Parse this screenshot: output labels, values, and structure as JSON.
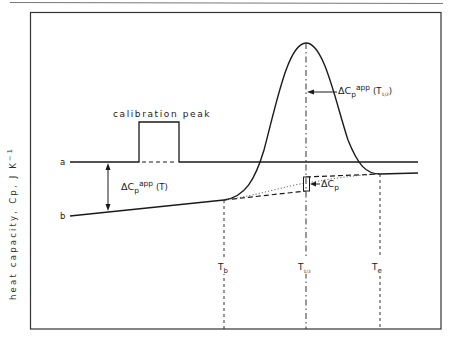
{
  "figure": {
    "y_axis_label": "heat  capacity, Cp,  J K",
    "y_axis_unit_exp": "−1",
    "calibration_label": "calibration  peak",
    "line_a_label": "a",
    "line_b_label": "b",
    "delta_cp_app_T": {
      "main": "ΔC",
      "sub": "p",
      "sup": "app",
      "arg": "(T)"
    },
    "delta_cp_app_Thalf": {
      "main": "ΔC",
      "sub": "p",
      "sup": "app",
      "arg_open": "(T",
      "arg_sub": "1/2",
      "arg_close": ")"
    },
    "delta_cp": {
      "main": "ΔC",
      "sub": "p"
    },
    "x_markers": [
      {
        "main": "T",
        "sub": "b"
      },
      {
        "main": "T",
        "sub": "1/2"
      },
      {
        "main": "T",
        "sub": "e"
      }
    ]
  },
  "colors": {
    "ink": "#1a1a1a",
    "frame": "#333333",
    "background": "#ffffff"
  }
}
